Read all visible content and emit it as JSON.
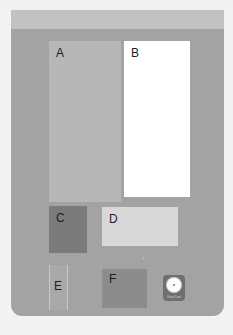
{
  "layout": {
    "blocks": [
      {
        "id": "A",
        "label": "A",
        "color": "#b7b7b7"
      },
      {
        "id": "B",
        "label": "B",
        "color": "#ffffff"
      },
      {
        "id": "C",
        "label": "C",
        "color": "#7b7b7b"
      },
      {
        "id": "D",
        "label": "D",
        "color": "#d8d8d8"
      },
      {
        "id": "E",
        "label": "E",
        "color": "#a9a9a9"
      },
      {
        "id": "F",
        "label": "F",
        "color": "#8c8c8c"
      }
    ],
    "app_icon": {
      "icon": "disc-icon",
      "caption": "FlashCam"
    }
  },
  "colors": {
    "panel": "#a3a3a3",
    "header_band": "#c2c2c2",
    "background": "#f3f3f3"
  }
}
